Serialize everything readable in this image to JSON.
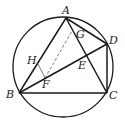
{
  "diagram": {
    "type": "geometry",
    "points": {
      "A": {
        "label": "A",
        "x": 66,
        "y": 18
      },
      "B": {
        "label": "B",
        "x": 19,
        "y": 93
      },
      "C": {
        "label": "C",
        "x": 107,
        "y": 93
      },
      "D": {
        "label": "D",
        "x": 107,
        "y": 44
      },
      "E": {
        "label": "E",
        "x": 86,
        "y": 57
      },
      "F": {
        "label": "F",
        "x": 45,
        "y": 78
      },
      "G": {
        "label": "G",
        "x": 72,
        "y": 31
      },
      "H": {
        "label": "H",
        "x": 37,
        "y": 62
      }
    },
    "circle": {
      "cx": 63,
      "cy": 67,
      "r": 50
    },
    "solid_segments": [
      "AB",
      "AC",
      "AD",
      "BC",
      "BD",
      "DC",
      "HF"
    ],
    "dashed_segments": [
      "FG"
    ],
    "line_color": "#1a1a1a"
  }
}
